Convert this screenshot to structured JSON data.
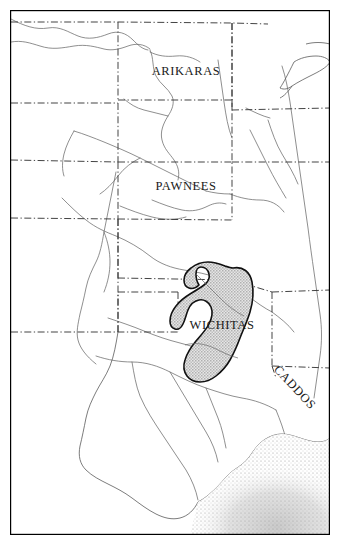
{
  "figure": {
    "kind": "historical-map",
    "frame": {
      "border_color": "#000000",
      "border_width_px": 1.2,
      "background_color": "#ffffff",
      "x": 10,
      "y": 10,
      "width": 320,
      "height": 525
    },
    "colors": {
      "coastline": "#555555",
      "river": "#5a5a5a",
      "state_border": "#3a3a3a",
      "territory_fill": "#c9c9c9",
      "territory_outline": "#111111",
      "water_stipple": "#8a8a8a",
      "label_text": "#1a1a1a"
    },
    "line_styles": {
      "state_border": "dash-dot",
      "river": "solid-thin",
      "coastline": "solid-thin",
      "territory_outline": "solid-medium"
    }
  },
  "labels": [
    {
      "id": "arikaras",
      "text": "ARIKARAS",
      "x": 186,
      "y": 75,
      "font_size": 12.5,
      "rotation": 0
    },
    {
      "id": "pawnees",
      "text": "PAWNEES",
      "x": 186,
      "y": 190,
      "font_size": 12.5,
      "rotation": 0
    },
    {
      "id": "wichitas",
      "text": "WICHITAS",
      "x": 222,
      "y": 329,
      "font_size": 12.5,
      "rotation": 0
    },
    {
      "id": "caddos",
      "text": "CADDOS",
      "x": 292,
      "y": 390,
      "font_size": 12.5,
      "rotation": 47
    }
  ],
  "territories": [
    {
      "id": "wichitas-range",
      "name": "WICHITAS",
      "fill": "#c9c9c9",
      "stroke": "#111111",
      "stroke_width": 1.6,
      "pattern": "stipple"
    }
  ],
  "water_bodies": [
    {
      "id": "gulf-of-mexico",
      "name": "Gulf of Mexico",
      "shading": "stipple"
    },
    {
      "id": "great-lake",
      "name": "Great Lake",
      "shading": "outline"
    }
  ],
  "legend": {
    "present": false,
    "note": "No legend, scale bar, or north arrow is drawn on this map."
  }
}
